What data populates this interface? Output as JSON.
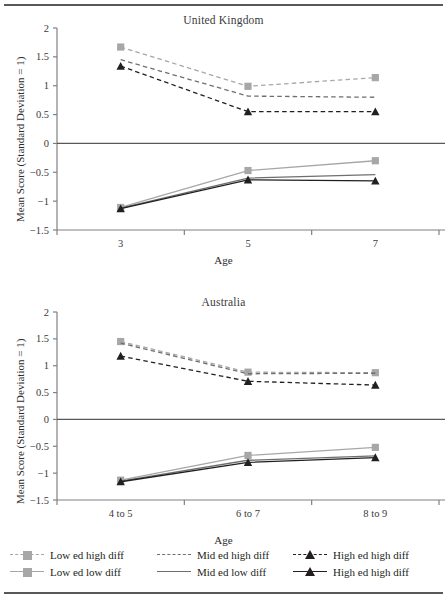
{
  "figure": {
    "ylabel": "Mean Score (Standard Deviation = 1)",
    "xlabel": "Age",
    "ytick_labels": [
      "2",
      "1.5",
      "1",
      "0.5",
      "0",
      "-0.5",
      "-1",
      "-1.5"
    ],
    "colors": {
      "low_ed": "#a7a7a9",
      "mid_ed": "#6f6f71",
      "high_ed": "#231f20",
      "axis": "#808083",
      "zero_line": "#58585a",
      "rule": "#58585a"
    }
  },
  "legend": {
    "columns": [
      {
        "rows": [
          {
            "label": "Low ed high diff",
            "marker": "square",
            "dash": "dashed",
            "color": "#a7a7a9",
            "name": "legend-low-ed-high-diff"
          },
          {
            "label": "Low ed low diff",
            "marker": "square",
            "dash": "solid",
            "color": "#a7a7a9",
            "name": "legend-low-ed-low-diff"
          }
        ]
      },
      {
        "rows": [
          {
            "label": "Mid ed high diff",
            "marker": "none",
            "dash": "dashed",
            "color": "#6f6f71",
            "name": "legend-mid-ed-high-diff"
          },
          {
            "label": "Mid ed low diff",
            "marker": "none",
            "dash": "solid",
            "color": "#6f6f71",
            "name": "legend-mid-ed-low-diff"
          }
        ]
      },
      {
        "rows": [
          {
            "label": "High ed high diff",
            "marker": "triangle",
            "dash": "dashed",
            "color": "#231f20",
            "name": "legend-high-ed-high-diff"
          },
          {
            "label": "High ed high diff",
            "marker": "triangle",
            "dash": "solid",
            "color": "#231f20",
            "name": "legend-high-ed-low-diff"
          }
        ]
      }
    ]
  },
  "chart_data": [
    {
      "type": "line",
      "title": "United Kingdom",
      "xlabel": "Age",
      "ylabel": "Mean Score (Standard Deviation = 1)",
      "categories": [
        "3",
        "5",
        "7"
      ],
      "ylim": [
        -1.5,
        2
      ],
      "yticks": [
        2,
        1.5,
        1,
        0.5,
        0,
        -0.5,
        -1,
        -1.5
      ],
      "grid": false,
      "legend_position": "bottom",
      "series": [
        {
          "name": "Low ed high diff",
          "values": [
            1.67,
            0.99,
            1.14
          ],
          "marker": "square",
          "dash": "dashed",
          "color": "#a7a7a9"
        },
        {
          "name": "Mid ed high diff",
          "values": [
            1.45,
            0.82,
            0.8
          ],
          "marker": "none",
          "dash": "dashed",
          "color": "#6f6f71"
        },
        {
          "name": "High ed high diff",
          "values": [
            1.34,
            0.55,
            0.55
          ],
          "marker": "triangle",
          "dash": "dashed",
          "color": "#231f20"
        },
        {
          "name": "Low ed low diff",
          "values": [
            -1.11,
            -0.47,
            -0.3
          ],
          "marker": "square",
          "dash": "solid",
          "color": "#a7a7a9"
        },
        {
          "name": "Mid ed low diff",
          "values": [
            -1.12,
            -0.6,
            -0.54
          ],
          "marker": "none",
          "dash": "solid",
          "color": "#6f6f71"
        },
        {
          "name": "High ed low diff",
          "values": [
            -1.13,
            -0.63,
            -0.65
          ],
          "marker": "triangle",
          "dash": "solid",
          "color": "#231f20"
        }
      ]
    },
    {
      "type": "line",
      "title": "Australia",
      "xlabel": "Age",
      "ylabel": "Mean Score (Standard Deviation = 1)",
      "categories": [
        "4 to 5",
        "6 to 7",
        "8 to 9"
      ],
      "ylim": [
        -1.5,
        2
      ],
      "yticks": [
        2,
        1.5,
        1,
        0.5,
        0,
        -0.5,
        -1,
        -1.5
      ],
      "grid": false,
      "legend_position": "bottom",
      "series": [
        {
          "name": "Low ed high diff",
          "values": [
            1.45,
            0.88,
            0.87
          ],
          "marker": "square",
          "dash": "dashed",
          "color": "#a7a7a9"
        },
        {
          "name": "Mid ed high diff",
          "values": [
            1.42,
            0.85,
            0.86
          ],
          "marker": "none",
          "dash": "dashed",
          "color": "#6f6f71"
        },
        {
          "name": "High ed high diff",
          "values": [
            1.18,
            0.71,
            0.64
          ],
          "marker": "triangle",
          "dash": "dashed",
          "color": "#231f20"
        },
        {
          "name": "Low ed low diff",
          "values": [
            -1.13,
            -0.67,
            -0.52
          ],
          "marker": "square",
          "dash": "solid",
          "color": "#a7a7a9"
        },
        {
          "name": "Mid ed low diff",
          "values": [
            -1.15,
            -0.76,
            -0.68
          ],
          "marker": "none",
          "dash": "solid",
          "color": "#6f6f71"
        },
        {
          "name": "High ed low diff",
          "values": [
            -1.16,
            -0.8,
            -0.71
          ],
          "marker": "triangle",
          "dash": "solid",
          "color": "#231f20"
        }
      ]
    }
  ]
}
